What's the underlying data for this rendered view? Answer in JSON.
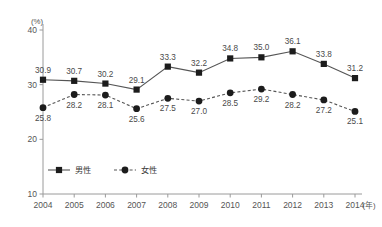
{
  "chart_data": {
    "type": "line",
    "title": "",
    "xlabel": "(年)",
    "ylabel": "(%)",
    "categories": [
      "2004",
      "2005",
      "2006",
      "2007",
      "2008",
      "2009",
      "2010",
      "2011",
      "2012",
      "2013",
      "2014"
    ],
    "series": [
      {
        "name": "男性",
        "marker": "square",
        "line_style": "solid",
        "values": [
          30.9,
          30.7,
          30.2,
          29.1,
          33.3,
          32.2,
          34.8,
          35.0,
          36.1,
          33.8,
          31.2
        ],
        "labels": [
          "30.9",
          "30.7",
          "30.2",
          "29.1",
          "33.3",
          "32.2",
          "34.8",
          "35.0",
          "36.1",
          "33.8",
          "31.2"
        ]
      },
      {
        "name": "女性",
        "marker": "circle",
        "line_style": "dashed",
        "values": [
          25.8,
          28.2,
          28.1,
          25.6,
          27.5,
          27.0,
          28.5,
          29.2,
          28.2,
          27.2,
          25.1
        ],
        "labels": [
          "25.8",
          "28.2",
          "28.1",
          "25.6",
          "27.5",
          "27.0",
          "28.5",
          "29.2",
          "28.2",
          "27.2",
          "25.1"
        ]
      }
    ],
    "ylim": [
      10,
      40
    ],
    "yticks": [
      10,
      20,
      30,
      40
    ],
    "ytick_labels": [
      "10",
      "20",
      "30",
      "40"
    ],
    "grid": false,
    "legend_position": "inside-bottom-left",
    "colors": {
      "marker": "#1c1c1c",
      "line": "#555555",
      "axis": "#9a9a9a",
      "text": "#4a4a4a",
      "background": "#ffffff"
    }
  }
}
